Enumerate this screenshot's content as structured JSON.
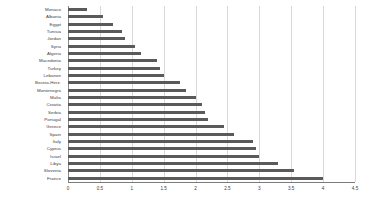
{
  "chart_data": {
    "type": "bar",
    "orientation": "horizontal",
    "title": "",
    "subtitle": "",
    "xlabel": "",
    "ylabel": "",
    "xlim": [
      0,
      4.5
    ],
    "xticks": [
      0,
      0.5,
      1,
      1.5,
      2,
      2.5,
      3,
      3.5,
      4,
      4.5
    ],
    "xtick_labels": [
      "0",
      "0.5",
      "1",
      "1.5",
      "2",
      "2.5",
      "3",
      "3.5",
      "4",
      "4.5"
    ],
    "grid": true,
    "grid_axis": "x",
    "legend": false,
    "legend_position": "none",
    "bar_color": "#5a5a5a",
    "grid_color": "#d9d9d9",
    "axis_color": "#7a7a7a",
    "categories": [
      "Monaco",
      "Albania",
      "Egypt",
      "Tunisia",
      "Jordan",
      "Syria",
      "Algeria",
      "Macedonia",
      "Turkey",
      "Lebanon",
      "Bosnia-Herz.",
      "Montenegro",
      "Malta",
      "Croatia",
      "Serbia",
      "Portugal",
      "Greece",
      "Spain",
      "Italy",
      "Cyprus",
      "Israel",
      "Libya",
      "Slovenia",
      "France"
    ],
    "values": [
      0.3,
      0.55,
      0.7,
      0.85,
      0.9,
      1.05,
      1.15,
      1.4,
      1.45,
      1.5,
      1.75,
      1.85,
      2.0,
      2.1,
      2.15,
      2.2,
      2.45,
      2.6,
      2.9,
      2.95,
      3.0,
      3.3,
      3.55,
      4.0
    ]
  }
}
